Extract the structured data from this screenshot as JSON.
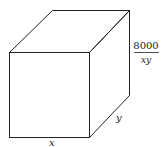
{
  "diagram": {
    "type": "rectangular-box",
    "labels": {
      "width": "x",
      "depth": "y",
      "height_numerator": "8000",
      "height_denominator": "xy"
    },
    "colors": {
      "stroke": "#222222",
      "background": "#ffffff"
    }
  }
}
